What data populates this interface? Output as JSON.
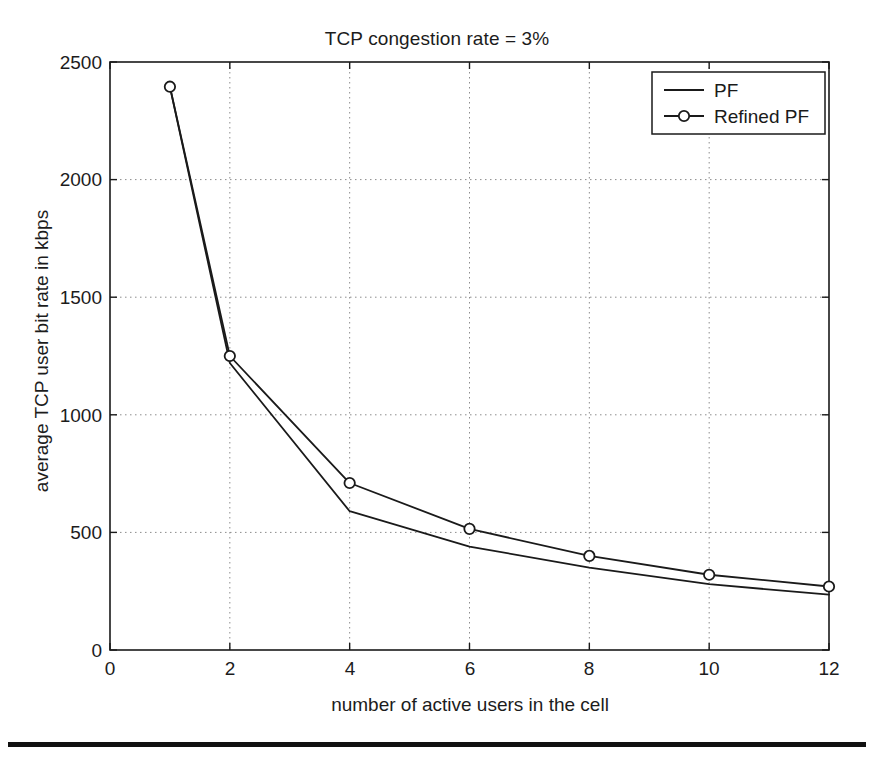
{
  "chart_data": {
    "type": "line",
    "title": "TCP congestion rate = 3%",
    "xlabel": "number of active users in the cell",
    "ylabel": "average TCP user bit rate in kbps",
    "x": [
      1,
      2,
      4,
      6,
      8,
      10,
      12
    ],
    "xlim": [
      0,
      12
    ],
    "ylim": [
      0,
      2500
    ],
    "xticks": [
      "0",
      "2",
      "4",
      "6",
      "8",
      "10",
      "12"
    ],
    "xtick_values": [
      0,
      2,
      4,
      6,
      8,
      10,
      12
    ],
    "yticks": [
      "0",
      "500",
      "1000",
      "1500",
      "2000",
      "2500"
    ],
    "ytick_values": [
      0,
      500,
      1000,
      1500,
      2000,
      2500
    ],
    "grid": true,
    "grid_style": "dotted",
    "legend_position": "top-right",
    "series": [
      {
        "name": "PF",
        "marker": "none",
        "color": "#1a1a1a",
        "values": [
          2395,
          1220,
          590,
          440,
          350,
          280,
          235
        ]
      },
      {
        "name": "Refined PF",
        "marker": "circle",
        "color": "#1a1a1a",
        "values": [
          2395,
          1250,
          710,
          515,
          400,
          320,
          270
        ]
      }
    ]
  },
  "legend": {
    "entries": [
      {
        "label": "PF"
      },
      {
        "label": "Refined PF"
      }
    ]
  },
  "colors": {
    "line": "#1a1a1a",
    "grid": "#8c8c8c",
    "axis": "#1a1a1a",
    "background": "#ffffff"
  }
}
